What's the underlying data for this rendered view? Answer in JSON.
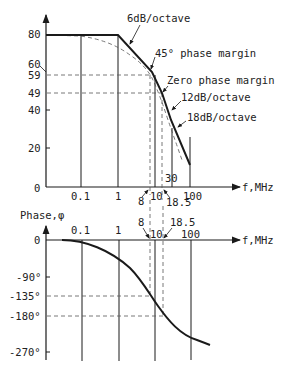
{
  "magnitude_plot": {
    "y_ticks": [
      "80",
      "60",
      "59",
      "49",
      "40",
      "20",
      "0"
    ],
    "x_ticks": [
      "0.1",
      "1",
      "10",
      "100"
    ],
    "x_axis_label": "f,MHz",
    "extra_labels": {
      "f8": "8",
      "f18_5": "18.5",
      "f30": "30"
    },
    "annotations": {
      "slope6": "6dB/octave",
      "pm45": "45° phase margin",
      "pm0": "Zero phase margin",
      "slope12": "12dB/octave",
      "slope18": "18dB/octave"
    }
  },
  "phase_plot": {
    "y_axis_label": "Phase,φ",
    "y_ticks": [
      "0",
      "-90°",
      "-135°",
      "-180°",
      "-270°"
    ],
    "x_ticks": [
      "0.1",
      "1",
      "10",
      "100"
    ],
    "x_axis_label": "f,MHz",
    "extra_labels": {
      "f8": "8",
      "f18_5": "18.5"
    }
  },
  "colors": {
    "line": "#1a1a1a",
    "dashed": "#555555",
    "background": "#ffffff"
  }
}
